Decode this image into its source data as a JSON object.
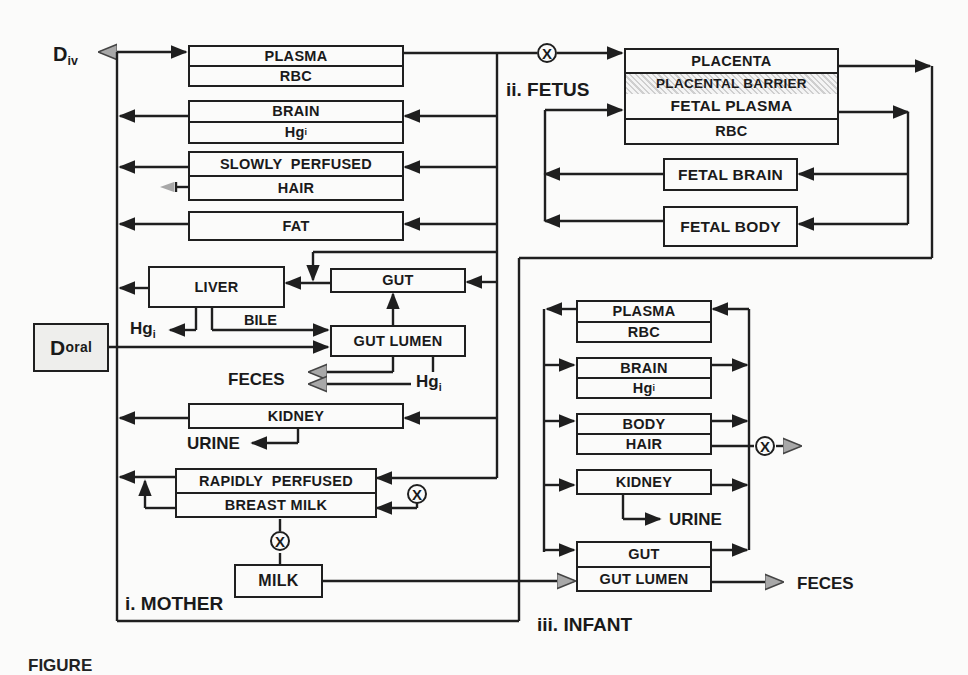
{
  "diagram": {
    "type": "pbpk-compartment-model",
    "sections": {
      "mother": "i. MOTHER",
      "fetus": "ii. FETUS",
      "infant": "iii. INFANT"
    },
    "inputs": {
      "iv_dose": {
        "main": "D",
        "sub": "iv"
      },
      "oral_dose": {
        "main": "D",
        "sub": "oral"
      }
    },
    "mother": {
      "plasma": {
        "top": "PLASMA",
        "bottom": "RBC"
      },
      "brain": {
        "top": "BRAIN",
        "bottom_main": "Hg",
        "bottom_sub": "i"
      },
      "slowly": {
        "top": "SLOWLY  PERFUSED",
        "bottom": "HAIR"
      },
      "fat": "FAT",
      "liver": "LIVER",
      "gut": "GUT",
      "bile": "BILE",
      "gut_lumen": "GUT LUMEN",
      "liver_hgi": {
        "main": "Hg",
        "sub": "i"
      },
      "lumen_hgi": {
        "main": "Hg",
        "sub": "i"
      },
      "feces": "FECES",
      "kidney": "KIDNEY",
      "urine": "URINE",
      "rapidly": {
        "top": "RAPIDLY  PERFUSED",
        "bottom": "BREAST MILK"
      },
      "milk": "MILK"
    },
    "fetus": {
      "placenta": "PLACENTA",
      "barrier": "PLACENTAL BARRIER",
      "fetal_plasma": "FETAL PLASMA",
      "rbc": "RBC",
      "fetal_brain": "FETAL BRAIN",
      "fetal_body": "FETAL BODY"
    },
    "infant": {
      "plasma": {
        "top": "PLASMA",
        "bottom": "RBC"
      },
      "brain": {
        "top": "BRAIN",
        "bottom_main": "Hg",
        "bottom_sub": "i"
      },
      "body": {
        "top": "BODY",
        "bottom": "HAIR"
      },
      "kidney": "KIDNEY",
      "urine": "URINE",
      "gut": {
        "top": "GUT",
        "bottom": "GUT LUMEN"
      },
      "feces": "FECES"
    },
    "multiplier_symbol": "X",
    "caption_partial": "FIGURE",
    "colors": {
      "line": "#1f1f1f",
      "grey_arrow": "#a8a8a8",
      "background": "#fbfbfa",
      "oral_box": "#eeeeec"
    }
  }
}
